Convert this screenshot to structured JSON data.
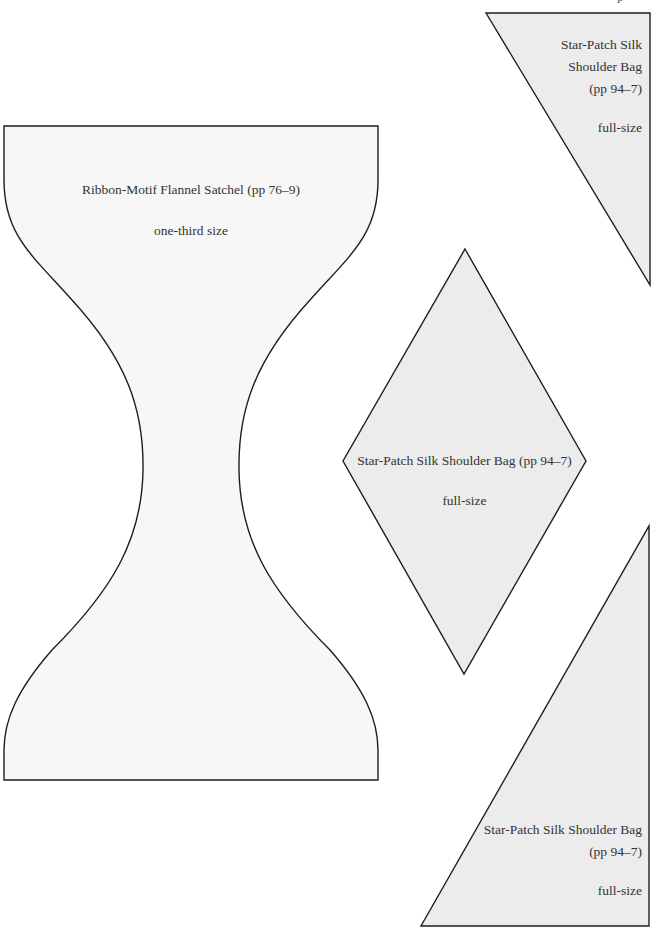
{
  "page": {
    "top_marker": "p",
    "colors": {
      "background": "#ffffff",
      "satchel_fill": "#f7f7f7",
      "patch_fill": "#ececec",
      "outline": "#1e1e1e",
      "text": "#333333"
    }
  },
  "templates": [
    {
      "id": "satchel",
      "shape": "hourglass",
      "title": "Ribbon-Motif Flannel Satchel (pp 76–9)",
      "scale": "one-third size"
    },
    {
      "id": "triangle-top-right",
      "shape": "right-triangle",
      "title_lines": [
        "Star-Patch Silk",
        "Shoulder Bag",
        "(pp 94–7)"
      ],
      "scale": "full-size"
    },
    {
      "id": "diamond",
      "shape": "diamond",
      "title": "Star-Patch Silk Shoulder Bag (pp 94–7)",
      "scale": "full-size"
    },
    {
      "id": "triangle-bottom-right",
      "shape": "right-triangle",
      "title_lines": [
        "Star-Patch Silk Shoulder Bag",
        "(pp 94–7)"
      ],
      "scale": "full-size"
    }
  ]
}
